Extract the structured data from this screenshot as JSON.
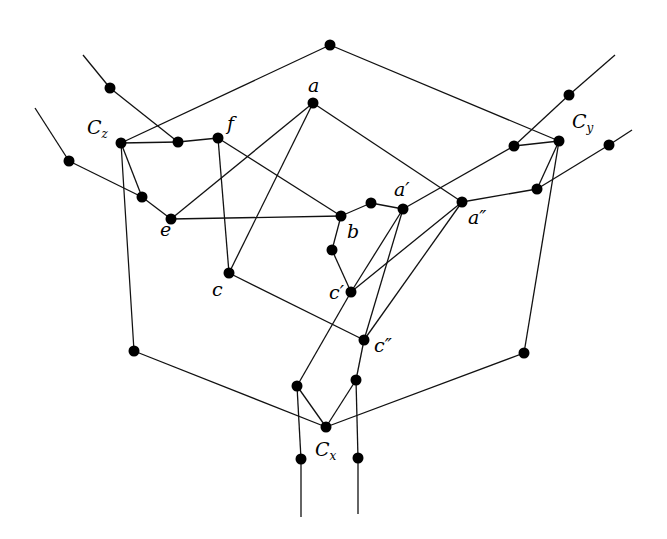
{
  "diagram": {
    "type": "graph",
    "labels": {
      "a": "a",
      "a1": "a′",
      "a2": "a″",
      "b": "b",
      "c": "c",
      "c1": "c′",
      "c2": "c″",
      "e": "e",
      "f": "f",
      "Cx_main": "C",
      "Cx_sub": "x",
      "Cy_main": "C",
      "Cy_sub": "y",
      "Cz_main": "C",
      "Cz_sub": "z"
    },
    "nodes": [
      {
        "id": "top",
        "x": 330,
        "y": 45
      },
      {
        "id": "a",
        "x": 313,
        "y": 103
      },
      {
        "id": "Cz",
        "x": 121,
        "y": 143
      },
      {
        "id": "zf",
        "x": 178,
        "y": 142
      },
      {
        "id": "f",
        "x": 218,
        "y": 138
      },
      {
        "id": "ul",
        "x": 110,
        "y": 88
      },
      {
        "id": "l",
        "x": 69,
        "y": 161
      },
      {
        "id": "zl",
        "x": 142,
        "y": 197
      },
      {
        "id": "e",
        "x": 171,
        "y": 219
      },
      {
        "id": "b",
        "x": 341,
        "y": 216
      },
      {
        "id": "ba",
        "x": 371,
        "y": 203
      },
      {
        "id": "a1",
        "x": 403,
        "y": 209
      },
      {
        "id": "a2",
        "x": 462,
        "y": 202
      },
      {
        "id": "Cy",
        "x": 559,
        "y": 141
      },
      {
        "id": "yl",
        "x": 514,
        "y": 146
      },
      {
        "id": "ur",
        "x": 569,
        "y": 95
      },
      {
        "id": "r",
        "x": 609,
        "y": 145
      },
      {
        "id": "yr",
        "x": 537,
        "y": 189
      },
      {
        "id": "bb",
        "x": 332,
        "y": 250
      },
      {
        "id": "c1",
        "x": 351,
        "y": 292
      },
      {
        "id": "c",
        "x": 229,
        "y": 273
      },
      {
        "id": "c2",
        "x": 364,
        "y": 340
      },
      {
        "id": "bl",
        "x": 134,
        "y": 351
      },
      {
        "id": "br",
        "x": 524,
        "y": 353
      },
      {
        "id": "xl",
        "x": 297,
        "y": 386
      },
      {
        "id": "xr",
        "x": 356,
        "y": 380
      },
      {
        "id": "Cx",
        "x": 326,
        "y": 427
      },
      {
        "id": "dl",
        "x": 301,
        "y": 459
      },
      {
        "id": "dr",
        "x": 358,
        "y": 458
      }
    ],
    "edges": [
      [
        "Cz",
        "top"
      ],
      [
        "top",
        "Cy"
      ],
      [
        "ul",
        "zf"
      ],
      [
        "Cz",
        "zf"
      ],
      [
        "zf",
        "f"
      ],
      [
        "l",
        "zl"
      ],
      [
        "Cz",
        "zl"
      ],
      [
        "zl",
        "e"
      ],
      [
        "Cz",
        "bl"
      ],
      [
        "bl",
        "Cx"
      ],
      [
        "f",
        "b"
      ],
      [
        "f",
        "c"
      ],
      [
        "a",
        "e"
      ],
      [
        "a",
        "c"
      ],
      [
        "a",
        "a2"
      ],
      [
        "e",
        "b"
      ],
      [
        "b",
        "ba"
      ],
      [
        "ba",
        "a1"
      ],
      [
        "a1",
        "yl"
      ],
      [
        "b",
        "bb"
      ],
      [
        "bb",
        "c1"
      ],
      [
        "c",
        "c2"
      ],
      [
        "a1",
        "c1"
      ],
      [
        "a1",
        "c2"
      ],
      [
        "a2",
        "c1"
      ],
      [
        "a2",
        "c2"
      ],
      [
        "a2",
        "yr"
      ],
      [
        "yr",
        "r"
      ],
      [
        "yl",
        "Cy"
      ],
      [
        "yl",
        "ur"
      ],
      [
        "Cy",
        "yr"
      ],
      [
        "Cy",
        "br"
      ],
      [
        "br",
        "Cx"
      ],
      [
        "c1",
        "xl"
      ],
      [
        "c2",
        "xr"
      ],
      [
        "xl",
        "Cx"
      ],
      [
        "xr",
        "Cx"
      ],
      [
        "xl",
        "dl"
      ],
      [
        "xr",
        "dr"
      ]
    ],
    "stubs": [
      {
        "from": "ul",
        "x2": 83,
        "y2": 55
      },
      {
        "from": "l",
        "x2": 35,
        "y2": 108
      },
      {
        "from": "ur",
        "x2": 615,
        "y2": 55
      },
      {
        "from": "r",
        "x2": 632,
        "y2": 130
      },
      {
        "from": "dl",
        "x2": 301,
        "y2": 517
      },
      {
        "from": "dr",
        "x2": 358,
        "y2": 514
      }
    ]
  }
}
